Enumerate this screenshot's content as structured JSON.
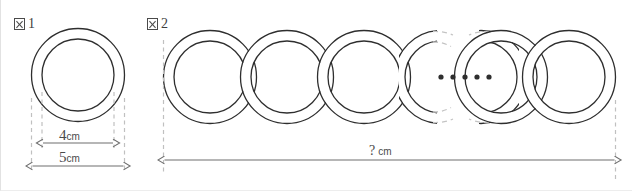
{
  "figures": [
    {
      "id": "figure-1",
      "label_glyph": "tofu-box-icon",
      "label_number": "1",
      "shape": "ring",
      "dimensions": [
        {
          "name": "inner-diameter",
          "value": "4",
          "unit": "cm"
        },
        {
          "name": "outer-diameter",
          "value": "5",
          "unit": "cm"
        }
      ]
    },
    {
      "id": "figure-2",
      "label_glyph": "tofu-box-icon",
      "label_number": "2",
      "shape": "chain-of-interlocking-rings",
      "ellipsis_dots": 5,
      "dimensions": [
        {
          "name": "total-length",
          "value": "?",
          "unit": "cm"
        }
      ]
    }
  ],
  "colors": {
    "stroke": "#2e2e2e",
    "dimension_line": "#6e6e6e",
    "guide_line": "#c0c0c0",
    "background": "#ffffff",
    "text": "#3f3f3f"
  }
}
